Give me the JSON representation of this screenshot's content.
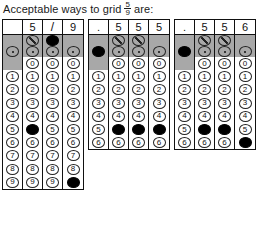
{
  "caption": {
    "before": "Acceptable ways to grid",
    "fraction": {
      "numerator": "5",
      "denominator": "9"
    },
    "after": "are:"
  },
  "symbols": {
    "slash": "/",
    "decimal": ".",
    "blank": ""
  },
  "digits": [
    "0",
    "1",
    "2",
    "3",
    "4",
    "5",
    "6",
    "7",
    "8",
    "9"
  ],
  "grids": [
    {
      "name": "grid-fraction-5-over-9",
      "left": 2,
      "columns": [
        {
          "answer": "",
          "has_slash": false,
          "has_dot": true,
          "slash_filled": false,
          "dot_filled": false,
          "has_zero": false,
          "digits_from": 1,
          "digits_to": 9,
          "filled_digit": null
        },
        {
          "answer": "5",
          "has_slash": true,
          "has_dot": true,
          "slash_filled": false,
          "dot_filled": false,
          "has_zero": true,
          "digits_from": 0,
          "digits_to": 9,
          "filled_digit": "5"
        },
        {
          "answer": "/",
          "has_slash": true,
          "has_dot": true,
          "slash_filled": true,
          "dot_filled": false,
          "has_zero": true,
          "digits_from": 0,
          "digits_to": 9,
          "filled_digit": null
        },
        {
          "answer": "9",
          "has_slash": false,
          "has_dot": true,
          "slash_filled": false,
          "dot_filled": false,
          "has_zero": true,
          "digits_from": 0,
          "digits_to": 9,
          "filled_digit": "9"
        }
      ]
    },
    {
      "name": "grid-decimal-555",
      "left": 88,
      "columns": [
        {
          "answer": ".",
          "has_slash": false,
          "has_dot": true,
          "slash_filled": false,
          "dot_filled": true,
          "has_zero": false,
          "digits_from": 1,
          "digits_to": 6,
          "filled_digit": null
        },
        {
          "answer": "5",
          "has_slash": true,
          "has_dot": true,
          "slash_filled": false,
          "dot_filled": false,
          "has_zero": true,
          "digits_from": 0,
          "digits_to": 6,
          "filled_digit": "5"
        },
        {
          "answer": "5",
          "has_slash": true,
          "has_dot": true,
          "slash_filled": false,
          "dot_filled": false,
          "has_zero": true,
          "digits_from": 0,
          "digits_to": 6,
          "filled_digit": "5"
        },
        {
          "answer": "5",
          "has_slash": false,
          "has_dot": true,
          "slash_filled": false,
          "dot_filled": false,
          "has_zero": true,
          "digits_from": 0,
          "digits_to": 6,
          "filled_digit": "5"
        }
      ]
    },
    {
      "name": "grid-decimal-556",
      "left": 174,
      "columns": [
        {
          "answer": ".",
          "has_slash": false,
          "has_dot": true,
          "slash_filled": false,
          "dot_filled": true,
          "has_zero": false,
          "digits_from": 1,
          "digits_to": 6,
          "filled_digit": null
        },
        {
          "answer": "5",
          "has_slash": true,
          "has_dot": true,
          "slash_filled": false,
          "dot_filled": false,
          "has_zero": true,
          "digits_from": 0,
          "digits_to": 6,
          "filled_digit": "5"
        },
        {
          "answer": "5",
          "has_slash": true,
          "has_dot": true,
          "slash_filled": false,
          "dot_filled": false,
          "has_zero": true,
          "digits_from": 0,
          "digits_to": 6,
          "filled_digit": "5"
        },
        {
          "answer": "6",
          "has_slash": false,
          "has_dot": true,
          "slash_filled": false,
          "dot_filled": false,
          "has_zero": true,
          "digits_from": 0,
          "digits_to": 6,
          "filled_digit": "6"
        }
      ]
    }
  ]
}
